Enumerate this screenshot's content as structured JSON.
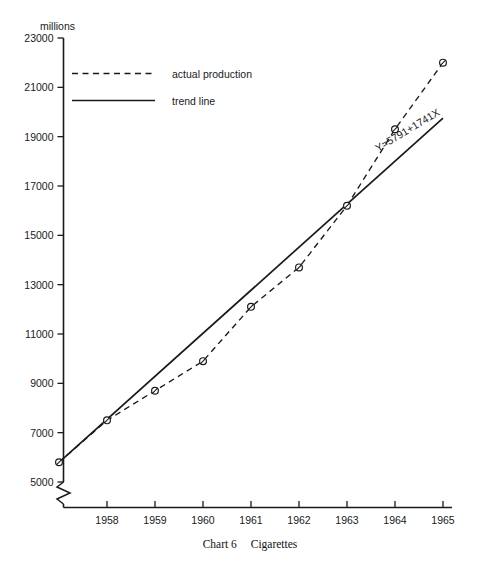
{
  "chart_data": {
    "type": "line",
    "title": "Chart 6   Cigarettes",
    "caption_number": "Chart 6",
    "caption_subject": "Cigarettes",
    "xlabel": "",
    "ylabel": "millions",
    "yunit_label": "millions",
    "ylim": [
      5000,
      23000
    ],
    "yticks": [
      5000,
      7000,
      9000,
      11000,
      13000,
      15000,
      17000,
      19000,
      21000,
      23000
    ],
    "ytick_labels": [
      "5000",
      "7000",
      "9000",
      "11000",
      "13000",
      "15000",
      "17000",
      "19000",
      "21000",
      "23000"
    ],
    "axis_break": true,
    "axis_break_note": "zigzag break on y-axis below 5000",
    "grid": false,
    "legend_position": "upper-left-inside",
    "x": [
      1957,
      1958,
      1959,
      1960,
      1961,
      1962,
      1963,
      1964,
      1965
    ],
    "categories": [
      "1958",
      "1959",
      "1960",
      "1961",
      "1962",
      "1963",
      "1964",
      "1965"
    ],
    "xtick_labels": [
      "1958",
      "1959",
      "1960",
      "1961",
      "1962",
      "1963",
      "1964",
      "1965"
    ],
    "series": [
      {
        "name": "actual production",
        "style": "dashed",
        "marker": "circle",
        "x": [
          1957,
          1958,
          1959,
          1960,
          1961,
          1962,
          1963,
          1964,
          1965
        ],
        "values": [
          5800,
          7500,
          8700,
          9900,
          12100,
          13700,
          16200,
          19300,
          22000
        ]
      },
      {
        "name": "trend line",
        "style": "solid",
        "marker": "none",
        "x": [
          1957,
          1965
        ],
        "values": [
          5800,
          19750
        ]
      }
    ],
    "annotations": [
      {
        "text": "Y=5791+1741X",
        "name": "trend-equation",
        "rotation_deg": -31,
        "near": "trend line upper right"
      }
    ],
    "legend_entries": [
      {
        "label": "actual production",
        "style": "dashed"
      },
      {
        "label": "trend line",
        "style": "solid"
      }
    ]
  }
}
